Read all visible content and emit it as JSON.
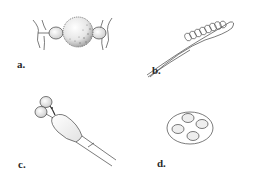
{
  "figure": {
    "panels": [
      {
        "id": "a",
        "label": "a.",
        "subject": "spiky spherical body between two lateral bulbs and branching filaments"
      },
      {
        "id": "b",
        "label": "b.",
        "subject": "elongated tapering spindle with spiral coils"
      },
      {
        "id": "c",
        "label": "c.",
        "subject": "club-shaped body with two round bulbs at apex"
      },
      {
        "id": "d",
        "label": "d.",
        "subject": "oval capsule containing four round bodies"
      }
    ]
  },
  "colors": {
    "ink": "#3a3a3a",
    "shade": "#bdbdbd",
    "background": "#ffffff"
  }
}
